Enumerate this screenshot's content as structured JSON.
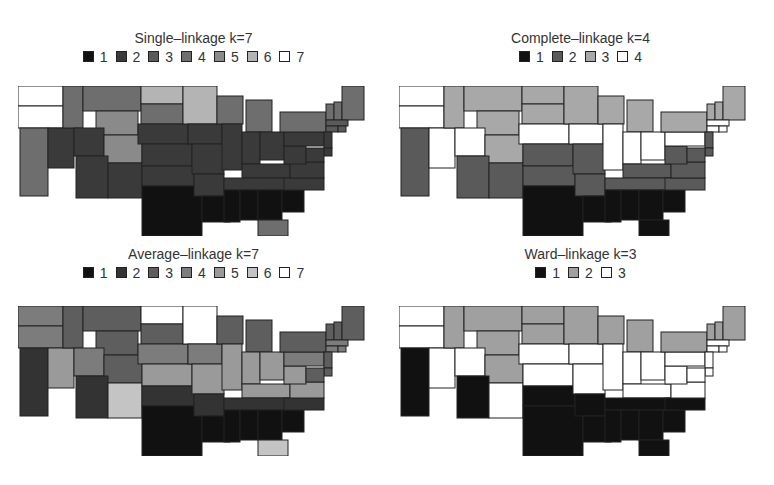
{
  "figure": {
    "panels": [
      {
        "id": "single",
        "title": "Single–linkage k=7",
        "legend": [
          "1",
          "2",
          "3",
          "4",
          "5",
          "6",
          "7"
        ],
        "colors": [
          "#111111",
          "#3a3a3a",
          "#5a5a5a",
          "#6e6e6e",
          "#8a8a8a",
          "#b4b4b4",
          "#ffffff"
        ]
      },
      {
        "id": "complete",
        "title": "Complete–linkage k=4",
        "legend": [
          "1",
          "2",
          "3",
          "4"
        ],
        "colors": [
          "#111111",
          "#5a5a5a",
          "#a8a8a8",
          "#ffffff"
        ]
      },
      {
        "id": "average",
        "title": "Average–linkage k=7",
        "legend": [
          "1",
          "2",
          "3",
          "4",
          "5",
          "6",
          "7"
        ],
        "colors": [
          "#111111",
          "#333333",
          "#5e5e5e",
          "#7c7c7c",
          "#9a9a9a",
          "#c4c4c4",
          "#ffffff"
        ]
      },
      {
        "id": "ward",
        "title": "Ward–linkage k=3",
        "legend": [
          "1",
          "2",
          "3"
        ],
        "colors": [
          "#111111",
          "#a0a0a0",
          "#ffffff"
        ]
      }
    ]
  },
  "chart_data": [
    {
      "type": "heatmap",
      "subtype": "choropleth",
      "title": "Single–linkage k=7",
      "legend": [
        "1",
        "2",
        "3",
        "4",
        "5",
        "6",
        "7"
      ],
      "clusters": {
        "WA": 7,
        "OR": 7,
        "CA": 4,
        "NV": 2,
        "ID": 4,
        "MT": 4,
        "WY": 5,
        "UT": 2,
        "CO": 5,
        "AZ": 2,
        "NM": 2,
        "ND": 6,
        "SD": 4,
        "NE": 2,
        "KS": 2,
        "OK": 2,
        "TX": 1,
        "MN": 6,
        "IA": 2,
        "MO": 2,
        "AR": 2,
        "LA": 1,
        "WI": 4,
        "IL": 2,
        "MI": 4,
        "IN": 2,
        "OH": 2,
        "KY": 2,
        "TN": 2,
        "MS": 1,
        "AL": 1,
        "GA": 1,
        "FL": 4,
        "SC": 1,
        "NC": 2,
        "VA": 2,
        "WV": 2,
        "PA": 2,
        "NY": 4,
        "VT": 4,
        "NH": 4,
        "ME": 4,
        "MA": 3,
        "CT": 3,
        "RI": 3,
        "NJ": 2,
        "DE": 2,
        "MD": 2
      }
    },
    {
      "type": "heatmap",
      "subtype": "choropleth",
      "title": "Complete–linkage k=4",
      "legend": [
        "1",
        "2",
        "3",
        "4"
      ],
      "clusters": {
        "WA": 4,
        "OR": 4,
        "CA": 2,
        "NV": 4,
        "ID": 3,
        "MT": 3,
        "WY": 3,
        "UT": 4,
        "CO": 3,
        "AZ": 2,
        "NM": 2,
        "ND": 3,
        "SD": 3,
        "NE": 4,
        "KS": 2,
        "OK": 2,
        "TX": 1,
        "MN": 3,
        "IA": 4,
        "MO": 2,
        "AR": 2,
        "LA": 1,
        "WI": 3,
        "IL": 4,
        "MI": 3,
        "IN": 4,
        "OH": 4,
        "KY": 2,
        "TN": 2,
        "MS": 1,
        "AL": 1,
        "GA": 1,
        "FL": 1,
        "SC": 1,
        "NC": 2,
        "VA": 2,
        "WV": 2,
        "PA": 4,
        "NY": 3,
        "VT": 3,
        "NH": 3,
        "ME": 3,
        "MA": 4,
        "CT": 4,
        "RI": 4,
        "NJ": 2,
        "DE": 2,
        "MD": 2
      }
    },
    {
      "type": "heatmap",
      "subtype": "choropleth",
      "title": "Average–linkage k=7",
      "legend": [
        "1",
        "2",
        "3",
        "4",
        "5",
        "6",
        "7"
      ],
      "clusters": {
        "WA": 4,
        "OR": 4,
        "CA": 2,
        "NV": 5,
        "ID": 3,
        "MT": 3,
        "WY": 3,
        "UT": 4,
        "CO": 3,
        "AZ": 2,
        "NM": 6,
        "ND": 7,
        "SD": 3,
        "NE": 4,
        "KS": 5,
        "OK": 2,
        "TX": 1,
        "MN": 7,
        "IA": 4,
        "MO": 5,
        "AR": 2,
        "LA": 1,
        "WI": 3,
        "IL": 5,
        "MI": 3,
        "IN": 5,
        "OH": 5,
        "KY": 5,
        "TN": 2,
        "MS": 1,
        "AL": 1,
        "GA": 1,
        "FL": 6,
        "SC": 1,
        "NC": 2,
        "VA": 5,
        "WV": 5,
        "PA": 4,
        "NY": 3,
        "VT": 3,
        "NH": 3,
        "ME": 3,
        "MA": 4,
        "CT": 4,
        "RI": 4,
        "NJ": 3,
        "DE": 3,
        "MD": 3
      }
    },
    {
      "type": "heatmap",
      "subtype": "choropleth",
      "title": "Ward–linkage k=3",
      "legend": [
        "1",
        "2",
        "3"
      ],
      "clusters": {
        "WA": 3,
        "OR": 3,
        "CA": 1,
        "NV": 3,
        "ID": 2,
        "MT": 2,
        "WY": 2,
        "UT": 3,
        "CO": 2,
        "AZ": 1,
        "NM": 3,
        "ND": 2,
        "SD": 2,
        "NE": 3,
        "KS": 3,
        "OK": 1,
        "TX": 1,
        "MN": 2,
        "IA": 3,
        "MO": 3,
        "AR": 1,
        "LA": 1,
        "WI": 2,
        "IL": 3,
        "MI": 2,
        "IN": 3,
        "OH": 3,
        "KY": 3,
        "TN": 1,
        "MS": 1,
        "AL": 1,
        "GA": 1,
        "FL": 1,
        "SC": 1,
        "NC": 1,
        "VA": 3,
        "WV": 3,
        "PA": 3,
        "NY": 2,
        "VT": 2,
        "NH": 2,
        "ME": 2,
        "MA": 3,
        "CT": 3,
        "RI": 3,
        "NJ": 3,
        "DE": 3,
        "MD": 3
      }
    }
  ]
}
